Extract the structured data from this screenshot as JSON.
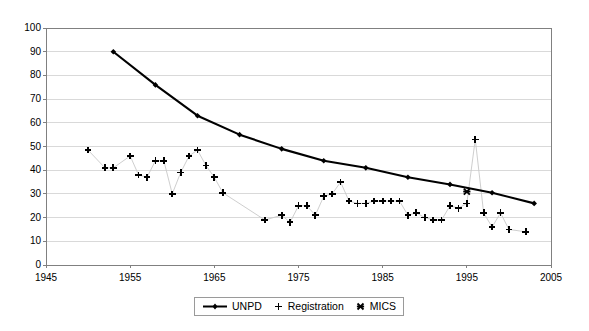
{
  "chart_data": {
    "type": "line",
    "title": "",
    "subtitle": "",
    "xlabel": "",
    "ylabel": "",
    "xlim": [
      1945,
      2005
    ],
    "ylim": [
      0,
      100
    ],
    "xticks": [
      1945,
      1955,
      1965,
      1975,
      1985,
      1995,
      2005
    ],
    "yticks": [
      0,
      10,
      20,
      30,
      40,
      50,
      60,
      70,
      80,
      90,
      100
    ],
    "grid": "horizontal",
    "legend_position": "bottom-center",
    "series": [
      {
        "name": "UNPD",
        "marker": "diamond",
        "color": "#000000",
        "line_width": 2.1,
        "points": [
          {
            "x": 1953,
            "y": 90
          },
          {
            "x": 1958,
            "y": 76
          },
          {
            "x": 1963,
            "y": 63
          },
          {
            "x": 1968,
            "y": 55
          },
          {
            "x": 1973,
            "y": 49
          },
          {
            "x": 1978,
            "y": 44
          },
          {
            "x": 1983,
            "y": 41
          },
          {
            "x": 1988,
            "y": 37
          },
          {
            "x": 1993,
            "y": 34
          },
          {
            "x": 1998,
            "y": 30.5
          },
          {
            "x": 2003,
            "y": 26
          }
        ]
      },
      {
        "name": "Registration",
        "marker": "plus",
        "color": "#000000",
        "line_color": "#c8c8c8",
        "line_width": 0.9,
        "points": [
          {
            "x": 1950,
            "y": 48.5
          },
          {
            "x": 1952,
            "y": 41
          },
          {
            "x": 1953,
            "y": 41
          },
          {
            "x": 1955,
            "y": 46
          },
          {
            "x": 1956,
            "y": 38
          },
          {
            "x": 1957,
            "y": 37
          },
          {
            "x": 1958,
            "y": 44
          },
          {
            "x": 1959,
            "y": 44
          },
          {
            "x": 1960,
            "y": 30
          },
          {
            "x": 1961,
            "y": 39
          },
          {
            "x": 1962,
            "y": 46
          },
          {
            "x": 1963,
            "y": 48.5
          },
          {
            "x": 1964,
            "y": 42
          },
          {
            "x": 1965,
            "y": 37
          },
          {
            "x": 1966,
            "y": 30.5
          },
          {
            "x": 1971,
            "y": 19
          },
          {
            "x": 1973,
            "y": 21
          },
          {
            "x": 1974,
            "y": 18
          },
          {
            "x": 1975,
            "y": 25
          },
          {
            "x": 1976,
            "y": 25
          },
          {
            "x": 1977,
            "y": 21
          },
          {
            "x": 1978,
            "y": 29
          },
          {
            "x": 1979,
            "y": 30
          },
          {
            "x": 1980,
            "y": 35
          },
          {
            "x": 1981,
            "y": 27
          },
          {
            "x": 1982,
            "y": 26
          },
          {
            "x": 1983,
            "y": 26
          },
          {
            "x": 1984,
            "y": 27
          },
          {
            "x": 1985,
            "y": 27
          },
          {
            "x": 1986,
            "y": 27
          },
          {
            "x": 1987,
            "y": 27
          },
          {
            "x": 1988,
            "y": 21
          },
          {
            "x": 1989,
            "y": 22
          },
          {
            "x": 1990,
            "y": 20
          },
          {
            "x": 1991,
            "y": 19
          },
          {
            "x": 1992,
            "y": 19
          },
          {
            "x": 1993,
            "y": 25
          },
          {
            "x": 1994,
            "y": 24
          },
          {
            "x": 1995,
            "y": 26
          },
          {
            "x": 1996,
            "y": 53
          },
          {
            "x": 1997,
            "y": 22
          },
          {
            "x": 1998,
            "y": 16
          },
          {
            "x": 1999,
            "y": 22
          },
          {
            "x": 2000,
            "y": 15
          },
          {
            "x": 2002,
            "y": 14
          }
        ]
      },
      {
        "name": "MICS",
        "marker": "cross",
        "color": "#000000",
        "points": [
          {
            "x": 1995,
            "y": 31
          }
        ]
      }
    ]
  },
  "legend": {
    "items": [
      {
        "label": "UNPD",
        "marker": "line-diamond"
      },
      {
        "label": "Registration",
        "marker": "plus"
      },
      {
        "label": "MICS",
        "marker": "cross"
      }
    ]
  }
}
